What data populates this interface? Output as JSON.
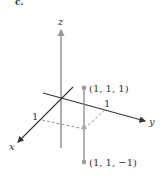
{
  "panel_label": "c.",
  "axes": {
    "x_label": "x",
    "y_label": "y",
    "z_label": "z",
    "x_tick": "1",
    "y_tick": "1"
  },
  "points": [
    {
      "label": "(1, 1, 1)",
      "coords": [
        1,
        1,
        1
      ]
    },
    {
      "label": "(1, 1, −1)",
      "coords": [
        1,
        1,
        -1
      ]
    }
  ],
  "colors": {
    "axis": "#333333",
    "point": "#a0a0a0",
    "segment": "#8a8a8a",
    "dashed": "#888888"
  }
}
